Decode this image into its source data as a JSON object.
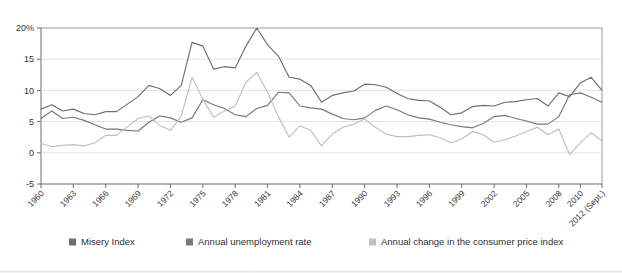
{
  "chart_data": {
    "type": "line",
    "title": "",
    "xlabel": "",
    "ylabel": "",
    "ylim": [
      -5,
      20
    ],
    "xlim": [
      1960,
      2012
    ],
    "grid": true,
    "legend_position": "bottom",
    "y_ticks": [
      20,
      15,
      10,
      5,
      0,
      -5
    ],
    "y_tick_labels": [
      "20%",
      "15",
      "10",
      "5",
      "0",
      "-5"
    ],
    "x_ticks": [
      1960,
      1963,
      1966,
      1969,
      1972,
      1975,
      1978,
      1981,
      1984,
      1987,
      1990,
      1993,
      1996,
      1999,
      2002,
      2005,
      2008,
      2010,
      2012
    ],
    "x_tick_labels": [
      "1960",
      "1963",
      "1966",
      "1969",
      "1972",
      "1975",
      "1978",
      "1981",
      "1984",
      "1987",
      "1990",
      "1993",
      "1996",
      "1999",
      "2002",
      "2005",
      "2008",
      "2010",
      "2012 (Sept.)"
    ],
    "x": [
      1960,
      1961,
      1962,
      1963,
      1964,
      1965,
      1966,
      1967,
      1968,
      1969,
      1970,
      1971,
      1972,
      1973,
      1974,
      1975,
      1976,
      1977,
      1978,
      1979,
      1980,
      1981,
      1982,
      1983,
      1984,
      1985,
      1986,
      1987,
      1988,
      1989,
      1990,
      1991,
      1992,
      1993,
      1994,
      1995,
      1996,
      1997,
      1998,
      1999,
      2000,
      2001,
      2002,
      2003,
      2004,
      2005,
      2006,
      2007,
      2008,
      2009,
      2010,
      2011,
      2012
    ],
    "series": [
      {
        "name": "Misery Index",
        "color": "#6e6e6e",
        "values": [
          7.0,
          7.7,
          6.7,
          7.0,
          6.3,
          6.1,
          6.6,
          6.6,
          7.8,
          9.0,
          10.8,
          10.3,
          9.2,
          10.8,
          17.7,
          17.1,
          13.4,
          13.8,
          13.6,
          17.1,
          20.0,
          17.3,
          15.5,
          12.1,
          11.8,
          10.8,
          8.1,
          9.2,
          9.6,
          9.9,
          11.0,
          10.9,
          10.5,
          9.5,
          8.7,
          8.4,
          8.3,
          7.3,
          6.1,
          6.4,
          7.4,
          7.6,
          7.5,
          8.1,
          8.2,
          8.5,
          8.7,
          7.5,
          9.6,
          9.0,
          11.2,
          12.1,
          10.0
        ]
      },
      {
        "name": "Annual unemployment rate",
        "color": "#777777",
        "values": [
          5.5,
          6.7,
          5.5,
          5.7,
          5.2,
          4.5,
          3.8,
          3.8,
          3.6,
          3.5,
          4.9,
          5.9,
          5.6,
          4.9,
          5.6,
          8.5,
          7.7,
          7.1,
          6.1,
          5.8,
          7.1,
          7.6,
          9.7,
          9.6,
          7.5,
          7.2,
          7.0,
          6.2,
          5.5,
          5.3,
          5.6,
          6.8,
          7.5,
          6.9,
          6.1,
          5.6,
          5.4,
          4.9,
          4.5,
          4.2,
          4.0,
          4.7,
          5.8,
          6.0,
          5.5,
          5.1,
          4.6,
          4.6,
          5.8,
          9.3,
          9.6,
          8.9,
          8.1
        ]
      },
      {
        "name": "Annual change in the consumer price index",
        "color": "#bfbfbf",
        "values": [
          1.5,
          1.0,
          1.2,
          1.3,
          1.1,
          1.6,
          2.8,
          2.8,
          4.2,
          5.5,
          5.9,
          4.4,
          3.6,
          5.9,
          12.1,
          8.6,
          5.7,
          6.7,
          7.5,
          11.3,
          12.9,
          9.7,
          5.8,
          2.5,
          4.3,
          3.6,
          1.1,
          3.0,
          4.1,
          4.6,
          5.4,
          4.1,
          3.0,
          2.6,
          2.6,
          2.8,
          2.9,
          2.4,
          1.6,
          2.2,
          3.4,
          2.9,
          1.7,
          2.1,
          2.7,
          3.4,
          4.1,
          2.9,
          3.8,
          -0.3,
          1.6,
          3.2,
          1.9
        ]
      }
    ]
  },
  "legend": {
    "items": [
      {
        "label": "Misery Index",
        "color": "#6e6e6e"
      },
      {
        "label": "Annual unemployment rate",
        "color": "#777777"
      },
      {
        "label": "Annual change in the consumer price index",
        "color": "#bfbfbf"
      }
    ]
  }
}
